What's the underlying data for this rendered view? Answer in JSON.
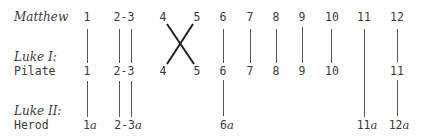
{
  "rows": {
    "matthew": {
      "label": "Matthew"
    },
    "luke1": {
      "label_line1": "Luke I:",
      "label_line2": "Pilate"
    },
    "luke2": {
      "label_line1": "Luke II:",
      "label_line2": "Herod"
    }
  },
  "matthew_items": [
    "1",
    "2-3",
    "4",
    "5",
    "6",
    "7",
    "8",
    "9",
    "10",
    "11",
    "12"
  ],
  "pilate_items": [
    "1",
    "2-3",
    "4",
    "5",
    "6",
    "7",
    "8",
    "9",
    "10",
    "11"
  ],
  "herod_items": [
    "1",
    "2-3",
    "6",
    "11",
    "12"
  ],
  "herod_suffix": "a",
  "line_color": "#4a4a4a",
  "connections": {
    "matthew_to_pilate": [
      [
        "1",
        "1"
      ],
      [
        "2-3",
        "2-3"
      ],
      [
        "4",
        "5"
      ],
      [
        "5",
        "4"
      ],
      [
        "6",
        "6"
      ],
      [
        "7",
        "7"
      ],
      [
        "8",
        "8"
      ],
      [
        "9",
        "9"
      ],
      [
        "10",
        "10"
      ],
      [
        "12",
        "11"
      ]
    ],
    "matthew_to_herod_through": [
      [
        "11",
        "11a"
      ]
    ],
    "pilate_to_herod": [
      [
        "1",
        "1a"
      ],
      [
        "2-3",
        "2-3a"
      ],
      [
        "6",
        "6a"
      ],
      [
        "11",
        "12a"
      ]
    ]
  }
}
